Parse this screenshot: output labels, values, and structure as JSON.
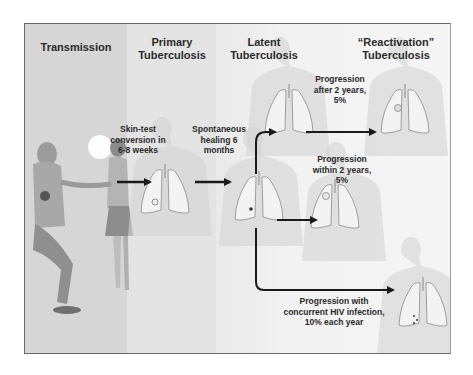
{
  "diagram": {
    "stages": [
      {
        "id": "transmission",
        "label": "Transmission"
      },
      {
        "id": "primary",
        "label_line1": "Primary",
        "label_line2": "Tuberculosis"
      },
      {
        "id": "latent",
        "label_line1": "Latent",
        "label_line2": "Tuberculosis"
      },
      {
        "id": "reactivation",
        "label_line1": "“Reactivation”",
        "label_line2": "Tuberculosis"
      }
    ],
    "transitions": [
      {
        "from": "transmission",
        "to": "primary",
        "line1": "Skin-test",
        "line2": "conversion in",
        "line3": "6-8 weeks"
      },
      {
        "from": "primary",
        "to": "latent",
        "line1": "Spontaneous",
        "line2": "healing 6",
        "line3": "months"
      },
      {
        "from": "latent",
        "to": "reactivation",
        "line1": "Progression",
        "line2": "after 2 years,",
        "line3": "5%"
      },
      {
        "from": "latent",
        "to": "reactivation",
        "line1": "Progression",
        "line2": "within 2 years,",
        "line3": "5%"
      },
      {
        "from": "latent",
        "to": "reactivation",
        "line1": "Progression with",
        "line2": "concurrent HIV infection,",
        "line3": "10% each year"
      }
    ],
    "nodes": [
      {
        "id": "primary-lungs",
        "stage": "primary"
      },
      {
        "id": "latent-lungs",
        "stage": "latent"
      },
      {
        "id": "reactivation-after-2y-lungs",
        "stage": "reactivation"
      },
      {
        "id": "reactivation-within-2y-lungs",
        "stage": "reactivation"
      },
      {
        "id": "reactivation-hiv-lungs",
        "stage": "reactivation"
      }
    ]
  }
}
